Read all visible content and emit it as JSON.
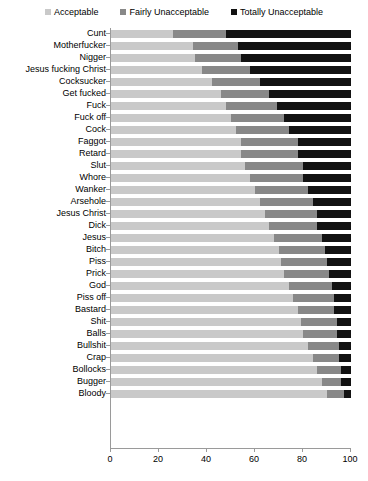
{
  "chart_data": {
    "type": "bar",
    "orientation": "horizontal",
    "stacked": true,
    "stack_mode": "percent",
    "title": "",
    "subtitle": "",
    "xlabel": "",
    "ylabel": "",
    "xlim": [
      0,
      100
    ],
    "xticks": [
      0,
      20,
      40,
      60,
      80,
      100
    ],
    "xtick_labels": [
      "0",
      "20",
      "40",
      "60",
      "80",
      "100"
    ],
    "grid": false,
    "legend_position": "top-center",
    "legend": [
      "Acceptable",
      "Fairly Unacceptable",
      "Totally Unacceptable"
    ],
    "colors": {
      "acceptable": "#c9c9c9",
      "fairly_unacceptable": "#888888",
      "totally_unacceptable": "#121212",
      "axis": "#9a9a9a",
      "text": "#000000",
      "background": "#ffffff"
    },
    "categories": [
      "Cunt",
      "Motherfucker",
      "Nigger",
      "Jesus fucking Christ",
      "Cocksucker",
      "Get fucked",
      "Fuck",
      "Fuck off",
      "Cock",
      "Faggot",
      "Retard",
      "Slut",
      "Whore",
      "Wanker",
      "Arsehole",
      "Jesus Christ",
      "Dick",
      "Jesus",
      "Bitch",
      "Piss",
      "Prick",
      "God",
      "Piss off",
      "Bastard",
      "Shit",
      "Balls",
      "Bullshit",
      "Crap",
      "Bollocks",
      "Bugger",
      "Bloody"
    ],
    "series": [
      {
        "name": "Acceptable",
        "color": "#c9c9c9",
        "values": [
          26,
          34,
          35,
          38,
          42,
          46,
          48,
          50,
          52,
          54,
          54,
          56,
          58,
          60,
          62,
          64,
          66,
          68,
          70,
          71,
          72,
          74,
          76,
          78,
          79,
          80,
          82,
          84,
          86,
          88,
          90
        ]
      },
      {
        "name": "Fairly Unacceptable",
        "color": "#888888",
        "values": [
          22,
          19,
          19,
          20,
          20,
          20,
          21,
          22,
          22,
          24,
          24,
          24,
          22,
          22,
          22,
          22,
          20,
          20,
          19,
          19,
          19,
          18,
          17,
          15,
          15,
          14,
          13,
          11,
          10,
          8,
          7
        ]
      },
      {
        "name": "Totally Unacceptable",
        "color": "#121212",
        "values": [
          52,
          47,
          46,
          42,
          38,
          34,
          31,
          28,
          26,
          22,
          22,
          20,
          20,
          18,
          16,
          14,
          14,
          12,
          11,
          10,
          9,
          8,
          7,
          7,
          6,
          6,
          5,
          5,
          4,
          4,
          3
        ]
      }
    ]
  }
}
